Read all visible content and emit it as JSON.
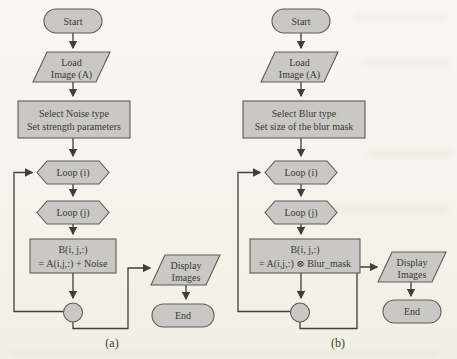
{
  "figure": {
    "colors": {
      "shape_fill": "#c9c8c4",
      "shape_stroke": "#5d5c58",
      "line_color": "#403e3a",
      "text_color": "#3a3834",
      "paper_background": "#f7f4ed"
    }
  },
  "flowchart_a": {
    "caption": "(a)",
    "nodes": {
      "start": {
        "label": "Start"
      },
      "load_image": {
        "line1": "Load",
        "line2": "Image (A)"
      },
      "setup": {
        "line1": "Select Noise type",
        "line2": "Set strength parameters"
      },
      "loop_i": {
        "label": "Loop (i)"
      },
      "loop_j": {
        "label": "Loop (j)"
      },
      "process": {
        "line1": "B(i, j,:)",
        "line2": "= A(i,j,:) + Noise"
      },
      "display": {
        "line1": "Display",
        "line2": "Images"
      },
      "end": {
        "label": "End"
      }
    }
  },
  "flowchart_b": {
    "caption": "(b)",
    "nodes": {
      "start": {
        "label": "Start"
      },
      "load_image": {
        "line1": "Load",
        "line2": "Image (A)"
      },
      "setup": {
        "line1": "Select Blur type",
        "line2": "Set size of the blur mask"
      },
      "loop_i": {
        "label": "Loop (i)"
      },
      "loop_j": {
        "label": "Loop (j)"
      },
      "process": {
        "line1": "B(i, j,:)",
        "line2": "= A(i,j,:) ⊗ Blur_mask"
      },
      "display": {
        "line1": "Display",
        "line2": "Images"
      },
      "end": {
        "label": "End"
      }
    }
  }
}
